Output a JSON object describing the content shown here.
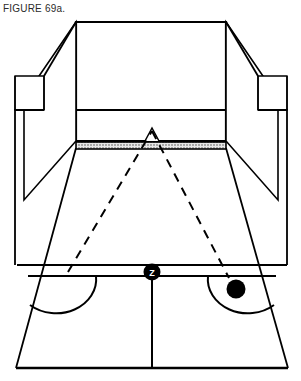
{
  "figure": {
    "caption": "FIGURE 69a."
  },
  "diagram": {
    "title": "FIGURE 69a.",
    "type": "basketball-court-perspective",
    "colors": {
      "line": "#000000",
      "fill": "#ffffff",
      "net_stipple_light": "#d9d9d9",
      "net_stipple_dot": "#555555",
      "marker": "#000000",
      "marker_text": "#ffffff",
      "caption_text": "#2b2b2b"
    },
    "markers": [
      {
        "name": "player-position-z",
        "label": "Z",
        "shape": "filled-circle-with-letter",
        "x": 152,
        "y": 272,
        "radius": 8
      },
      {
        "name": "ball",
        "label": "",
        "shape": "filled-circle",
        "x": 236,
        "y": 289,
        "radius": 9
      }
    ],
    "trajectories": [
      {
        "name": "shot-path-outgoing",
        "style": "dashed",
        "from": [
          68,
          270
        ],
        "to": [
          152,
          131
        ]
      },
      {
        "name": "shot-path-return",
        "style": "dashed",
        "from": [
          152,
          131
        ],
        "to": [
          228,
          275
        ]
      }
    ],
    "court_features": [
      "far-backboard-and-backstop",
      "far-court-wall",
      "net-band",
      "left-bleacher-wall",
      "right-bleacher-wall",
      "near-free-throw-line",
      "near-free-throw-circle-left",
      "near-free-throw-circle-right",
      "center-line",
      "baseline"
    ]
  }
}
